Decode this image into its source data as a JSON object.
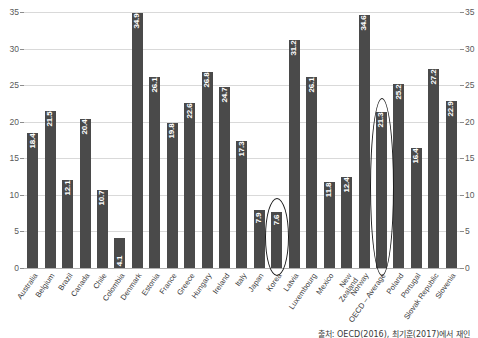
{
  "chart_data": {
    "type": "bar",
    "title": "",
    "subtitle": "",
    "xlabel": "",
    "ylabel": "",
    "ylim": [
      0,
      35
    ],
    "yticks": [
      0,
      5,
      10,
      15,
      20,
      25,
      30,
      35
    ],
    "grid": true,
    "legend": null,
    "dual_axis": true,
    "categories": [
      "Australia",
      "Belgium",
      "Brazil",
      "Canada",
      "Chile",
      "Colombia",
      "Denmark",
      "Estonia",
      "France",
      "Greece",
      "Hungary",
      "Ireland",
      "Italy",
      "Japan",
      "Korea",
      "Latvia",
      "Luxembourg",
      "Mexico",
      "New Zealand",
      "Norway",
      "OECD – Average",
      "Poland",
      "Portugal",
      "Slovak Republic",
      "Slovenia"
    ],
    "values": [
      18.4,
      21.5,
      12.1,
      20.4,
      10.7,
      4.1,
      34.9,
      26.1,
      19.8,
      22.6,
      26.8,
      24.7,
      17.3,
      7.9,
      7.6,
      31.2,
      26.1,
      11.8,
      12.4,
      34.6,
      21.3,
      25.2,
      16.4,
      27.2,
      22.9
    ],
    "annotations": [
      {
        "label": "Korea",
        "category": "Korea",
        "shape": "ellipse",
        "value": 7.6
      },
      {
        "label": "OECD – Average",
        "category": "OECD – Average",
        "shape": "ellipse",
        "value": 21.3
      }
    ],
    "bar_color": "#4a4a4a",
    "grid_color": "#d9d9d9",
    "value_label_color": "#ffffff"
  },
  "source": {
    "text": "출처: OECD(2016), 최기훈(2017)에서 재인"
  },
  "category_lines": [
    [
      "Australia"
    ],
    [
      "Belgium"
    ],
    [
      "Brazil"
    ],
    [
      "Canada"
    ],
    [
      "Chile"
    ],
    [
      "Colombia"
    ],
    [
      "Denmark"
    ],
    [
      "Estonia"
    ],
    [
      "France"
    ],
    [
      "Greece"
    ],
    [
      "Hungary"
    ],
    [
      "Ireland"
    ],
    [
      "Italy"
    ],
    [
      "Japan"
    ],
    [
      "Korea"
    ],
    [
      "Latvia"
    ],
    [
      "Luxembourg"
    ],
    [
      "Mexico"
    ],
    [
      "New",
      "Zealand"
    ],
    [
      "Norway"
    ],
    [
      "OECD – Average"
    ],
    [
      "Poland"
    ],
    [
      "Portugal"
    ],
    [
      "Slovak Republic"
    ],
    [
      "Slovenia"
    ]
  ]
}
